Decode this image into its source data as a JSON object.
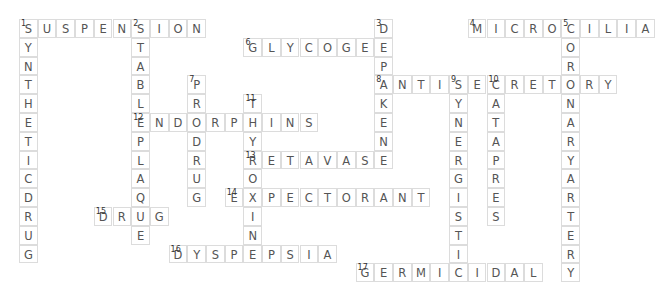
{
  "puzzle": {
    "cell_size": [
      18.7,
      18.8
    ],
    "words": [
      {
        "number": 1,
        "answer": "SUSPENSION",
        "direction": "across",
        "col": 0,
        "row": 0
      },
      {
        "number": 1,
        "answer": "SYNTHETICDRUG",
        "direction": "down",
        "col": 0,
        "row": 0
      },
      {
        "number": 2,
        "answer": "STABLEPLAQUE",
        "direction": "down",
        "col": 6,
        "row": 0
      },
      {
        "number": 3,
        "answer": "DEPAKENE",
        "direction": "down",
        "col": 19,
        "row": 0
      },
      {
        "number": 4,
        "answer": "MICROCILIA",
        "direction": "across",
        "col": 24,
        "row": 0
      },
      {
        "number": 5,
        "answer": "CORONARYARTERY",
        "direction": "down",
        "col": 29,
        "row": 0
      },
      {
        "number": 6,
        "answer": "GLYCOGEN",
        "direction": "across",
        "col": 12,
        "row": 1
      },
      {
        "number": 7,
        "answer": "PRODRUG",
        "direction": "down",
        "col": 9,
        "row": 3
      },
      {
        "number": 8,
        "answer": "ANTISECRETORY",
        "direction": "across",
        "col": 19,
        "row": 3
      },
      {
        "number": 9,
        "answer": "SYNERGISTIC",
        "direction": "down",
        "col": 23,
        "row": 3
      },
      {
        "number": 10,
        "answer": "CATAPRES",
        "direction": "down",
        "col": 25,
        "row": 3
      },
      {
        "number": 11,
        "answer": "THYROXIN",
        "direction": "down",
        "col": 12,
        "row": 4
      },
      {
        "number": 12,
        "answer": "ENDORPHINS",
        "direction": "across",
        "col": 6,
        "row": 5
      },
      {
        "number": 13,
        "answer": "RETAVASE",
        "direction": "across",
        "col": 12,
        "row": 7
      },
      {
        "number": 14,
        "answer": "EXPECTORANT",
        "direction": "across",
        "col": 11,
        "row": 9
      },
      {
        "number": 15,
        "answer": "DRUG",
        "direction": "across",
        "col": 4,
        "row": 10
      },
      {
        "number": 16,
        "answer": "DYSPEPSIA",
        "direction": "across",
        "col": 8,
        "row": 12
      },
      {
        "number": 17,
        "answer": "GERMICIDAL",
        "direction": "across",
        "col": 18,
        "row": 13
      }
    ]
  }
}
